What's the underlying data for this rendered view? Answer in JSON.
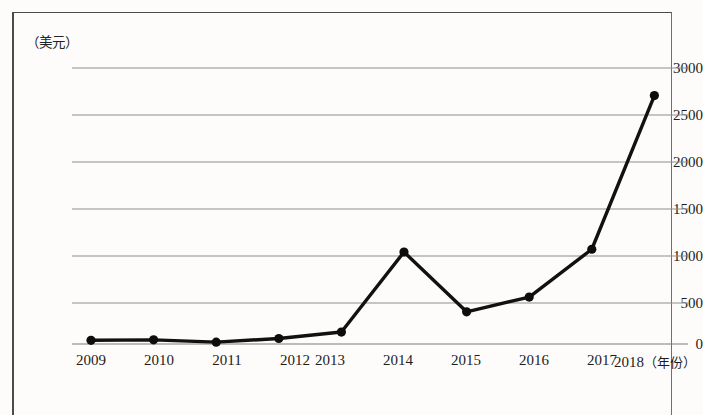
{
  "figure": {
    "unit_label": "（美元）",
    "x_axis_caption": "（年份）"
  },
  "axes": {
    "y_ticks": [
      "0",
      "500",
      "1000",
      "1500",
      "2000",
      "2500",
      "3000"
    ],
    "x_ticks": [
      "2009",
      "2010",
      "2011",
      "2012",
      "2013",
      "2014",
      "2015",
      "2016",
      "2017",
      "2018"
    ],
    "last_x_tick_suffix": "（年份）"
  },
  "colors": {
    "line": "#111111",
    "marker": "#0d0d0d",
    "gridline": "#8e8e8e",
    "frame": "#4a4a4a",
    "background": "#fdfcfa",
    "text": "#1d1d1d"
  },
  "chart_data": {
    "type": "line",
    "title": "",
    "xlabel": "（年份）",
    "ylabel": "（美元）",
    "categories": [
      "2009",
      "2010",
      "2011",
      "2012",
      "2013",
      "2014",
      "2015",
      "2016",
      "2017",
      "2018"
    ],
    "values": [
      40,
      45,
      20,
      60,
      130,
      1000,
      350,
      510,
      1030,
      2700
    ],
    "ylim": [
      0,
      3000
    ],
    "yticks": [
      0,
      500,
      1000,
      1500,
      2000,
      2500,
      3000
    ],
    "grid": true,
    "legend": "none",
    "markers": true,
    "series": [
      {
        "name": "值",
        "values": [
          40,
          45,
          20,
          60,
          130,
          1000,
          350,
          510,
          1030,
          2700
        ]
      }
    ]
  }
}
